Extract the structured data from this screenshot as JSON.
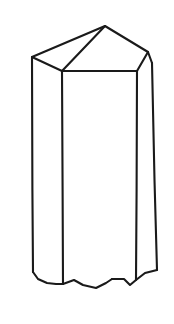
{
  "figure": {
    "name": "hexagonal-prism-crystal-line-drawing",
    "style": "black-and-white line drawing",
    "canvas": {
      "width": 174,
      "height": 324
    },
    "colors": {
      "background": "#ffffff",
      "stroke": "#1a1a1a",
      "fill": "#ffffff"
    },
    "stroke_width": 2.1,
    "vertices": {
      "apex": [
        105,
        26
      ],
      "left_shoulder": [
        32,
        57
      ],
      "right_shoulder": [
        148,
        52
      ],
      "right_upper_bend": [
        152,
        63
      ],
      "front_center_top": [
        62,
        71
      ],
      "front_right_top": [
        137,
        71
      ],
      "left_bottom": [
        33,
        272
      ],
      "front_center_bottom": [
        63,
        284
      ],
      "front_right_bottom": [
        136,
        280
      ],
      "right_bottom": [
        157,
        270
      ]
    },
    "edges": [
      {
        "name": "top-left-ridge",
        "from": "left_shoulder",
        "to": "apex"
      },
      {
        "name": "top-right-ridge",
        "from": "apex",
        "to": "right_shoulder"
      },
      {
        "name": "right-upper-facet-edge",
        "from": "right_shoulder",
        "to": "right_upper_bend"
      },
      {
        "name": "front-left-top-edge",
        "from": "left_shoulder",
        "to": "front_center_top"
      },
      {
        "name": "front-center-ridge",
        "from": "front_center_top",
        "to": "apex"
      },
      {
        "name": "front-right-top-edge",
        "from": "front_center_top",
        "to": "front_right_top"
      },
      {
        "name": "right-front-ridge",
        "from": "front_right_top",
        "to": "right_shoulder"
      },
      {
        "name": "left-vertical-edge",
        "from": "left_shoulder",
        "to": "left_bottom"
      },
      {
        "name": "front-center-vertical-edge",
        "from": "front_center_top",
        "to": "front_center_bottom"
      },
      {
        "name": "front-right-vertical-edge",
        "from": "front_right_top",
        "to": "front_right_bottom"
      },
      {
        "name": "right-vertical-edge",
        "from": "right_upper_bend",
        "to": "right_bottom"
      },
      {
        "name": "broken-base-edge",
        "from": "left_bottom",
        "to": "right_bottom"
      }
    ],
    "paths": {
      "top_left_facet": "M 32 57 L 105 26 L 62 71 Z",
      "top_right_facet": "M 105 26 L 148 52 L 137 71 L 62 71 Z",
      "right_sliver_facet": "M 148 52 L 152 63 L 137 71 Z",
      "left_body_face": "M 32 57 L 62 71 L 63 284 L 33 272 Z",
      "front_body_face": "M 62 71 L 137 71 L 136 280 L 63 284 Z",
      "right_body_face": "M 137 71 L 152 63 L 157 270 L 136 280 Z",
      "outline_top": "M 32 57 L 105 26 L 148 52 L 152 63",
      "ridge_apex_to_front": "M 105 26 L 62 71",
      "top_front_left_edge": "M 32 57 L 62 71",
      "top_front_right_edge": "M 62 71 L 137 71",
      "top_right_front_ridge": "M 137 71 L 148 52",
      "edge_left_vertical": "M 32 57 L 32.4 190 L 33 272",
      "edge_center_vertical": "M 62 71 L 62.6 190 L 63 284",
      "edge_front_right_vertical": "M 137 71 L 136.6 190 L 136 280",
      "edge_right_vertical": "M 152 63 L 154.5 180 L 157 270",
      "base_broken_left": "M 33 272 L 38 279 L 47 283 L 56 284 L 63 284",
      "base_broken_mid": "M 63 284 L 74 280 L 83 285 L 96 288 L 106 283 L 112 279",
      "base_broken_right": "M 112 279 L 124 279 L 130 285 L 136 280 L 145 273 L 157 270"
    }
  }
}
